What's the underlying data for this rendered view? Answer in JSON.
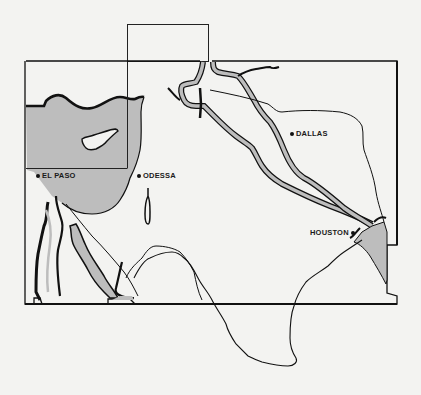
{
  "map": {
    "type": "regional outline map",
    "colors": {
      "background": "#f3f3f1",
      "shaded_region": "#bdbdbd",
      "outline": "#1a1a1a"
    },
    "cities": [
      {
        "name": "EL PASO",
        "x": 36,
        "y": 176,
        "dot_side": "left"
      },
      {
        "name": "ODESSA",
        "x": 137,
        "y": 176,
        "dot_side": "left"
      },
      {
        "name": "DALLAS",
        "x": 290,
        "y": 134,
        "dot_side": "left"
      },
      {
        "name": "HOUSTON",
        "x": 310,
        "y": 233,
        "dot_side": "right"
      }
    ]
  }
}
